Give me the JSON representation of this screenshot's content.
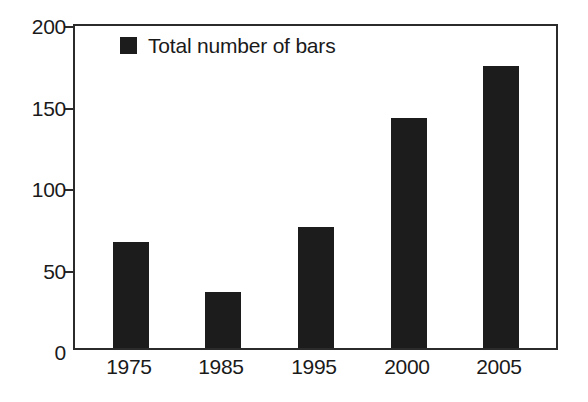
{
  "chart_data": {
    "type": "bar",
    "title": "",
    "subtitle": "",
    "xlabel": "",
    "ylabel": "",
    "categories": [
      "1975",
      "1985",
      "1995",
      "2000",
      "2005"
    ],
    "values": [
      66,
      35,
      75,
      143,
      175
    ],
    "series": [
      {
        "name": "Total number of bars",
        "values": [
          66,
          35,
          75,
          143,
          175
        ],
        "color": "#1c1c1c"
      }
    ],
    "ylim": [
      0,
      200
    ],
    "yticks": [
      0,
      50,
      100,
      150,
      200
    ],
    "ytick_labels": [
      "0",
      "50",
      "100",
      "150",
      "200"
    ],
    "grid": false,
    "legend": {
      "position": "top-left-inside",
      "entries": [
        {
          "label": "Total number of bars",
          "color": "#1c1c1c",
          "marker": "square-swatch"
        }
      ]
    },
    "frame": "full-box",
    "bar_color": "#1c1c1c",
    "axis_color": "#2b2b2b",
    "background": "#ffffff"
  }
}
